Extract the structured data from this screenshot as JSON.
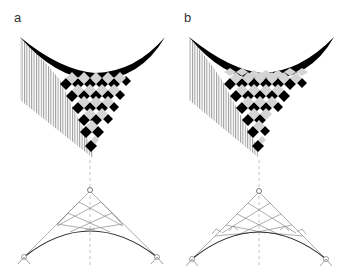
{
  "figure": {
    "panels": [
      {
        "id": "a",
        "label": "a",
        "top_view": "shaded cube-pattern (diamond grid) surface under curved edge with vertical hatching",
        "bottom_view": "diagonal grid network between arch and apex with pinned supports"
      },
      {
        "id": "b",
        "label": "b",
        "top_view": "shaded cube-pattern surface with denser staggered diamonds",
        "bottom_view": "diagonal grid network with additional small triangular infills along arch"
      }
    ],
    "colors": {
      "ink": "#000000",
      "hatch": "#9a9a9a",
      "light_face": "#d4d4d4",
      "grid_line": "#8a8a8a",
      "arch": "#333333"
    }
  }
}
